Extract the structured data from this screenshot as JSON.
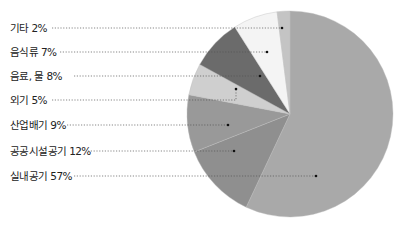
{
  "chart_data": {
    "type": "pie",
    "title": "",
    "start_angle_deg": 0,
    "direction": "clockwise",
    "center": [
      290,
      114
    ],
    "radius": 103,
    "slices": [
      {
        "label": "실내공기",
        "value": 57,
        "display": "실내공기 57%",
        "color": "#a9a9a9",
        "label_y": 176,
        "dot": [
          316,
          176
        ]
      },
      {
        "label": "공공시설공기",
        "value": 12,
        "display": "공공시설공기 12%",
        "color": "#8f8f8f",
        "label_y": 151,
        "dot": [
          234,
          151
        ]
      },
      {
        "label": "산업배기",
        "value": 9,
        "display": "산업배기 9%",
        "color": "#999999",
        "label_y": 125,
        "dot": [
          228,
          125
        ]
      },
      {
        "label": "외기",
        "value": 5,
        "display": "외기 5%",
        "color": "#cfcfcf",
        "label_y": 100,
        "dot": [
          236,
          100
        ],
        "elbow_y": 89
      },
      {
        "label": "음료, 물",
        "value": 8,
        "display": "음료, 물 8%",
        "color": "#6b6b6b",
        "label_y": 76,
        "dot": [
          260,
          76
        ]
      },
      {
        "label": "음식류",
        "value": 7,
        "display": "음식류 7%",
        "color": "#f4f4f4",
        "label_y": 52,
        "dot": [
          267,
          52
        ]
      },
      {
        "label": "기타",
        "value": 2,
        "display": "기타 2%",
        "color": "#c4c4c4",
        "label_y": 28,
        "dot": [
          282,
          28
        ]
      }
    ],
    "legend": "none",
    "grid": false
  }
}
